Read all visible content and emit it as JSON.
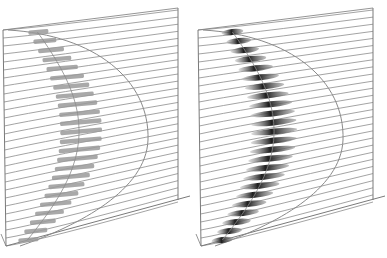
{
  "figure": {
    "panels": [
      {
        "id": "left",
        "marker_style": "flat",
        "marker_color": "#8a8a8a",
        "line_count": 28
      },
      {
        "id": "right",
        "marker_style": "shaded",
        "marker_color": "#222222",
        "line_count": 28
      }
    ],
    "colors": {
      "background": "#ffffff",
      "grid_line": "#8c8c8c",
      "frame_line": "#7a7a7a",
      "curve_line": "#8a8a8a",
      "marker_light": "#9a9a9a",
      "marker_dark": "#1e1e1e"
    }
  }
}
